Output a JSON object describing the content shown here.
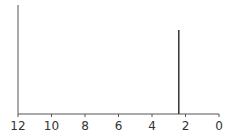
{
  "chart_data": {
    "type": "bar",
    "title": "",
    "xlabel": "",
    "ylabel": "",
    "x_reversed": true,
    "xlim": [
      12,
      0
    ],
    "x_ticks": [
      12,
      10,
      8,
      6,
      4,
      2,
      0
    ],
    "x_tick_labels": [
      "12",
      "10",
      "8",
      "6",
      "4",
      "2",
      "0"
    ],
    "peaks": [
      {
        "x": 2.4,
        "relative_height": 0.77
      }
    ],
    "grid": false,
    "legend": null
  },
  "colors": {
    "axis": "#555555",
    "peak": "#333333",
    "text": "#333333"
  }
}
